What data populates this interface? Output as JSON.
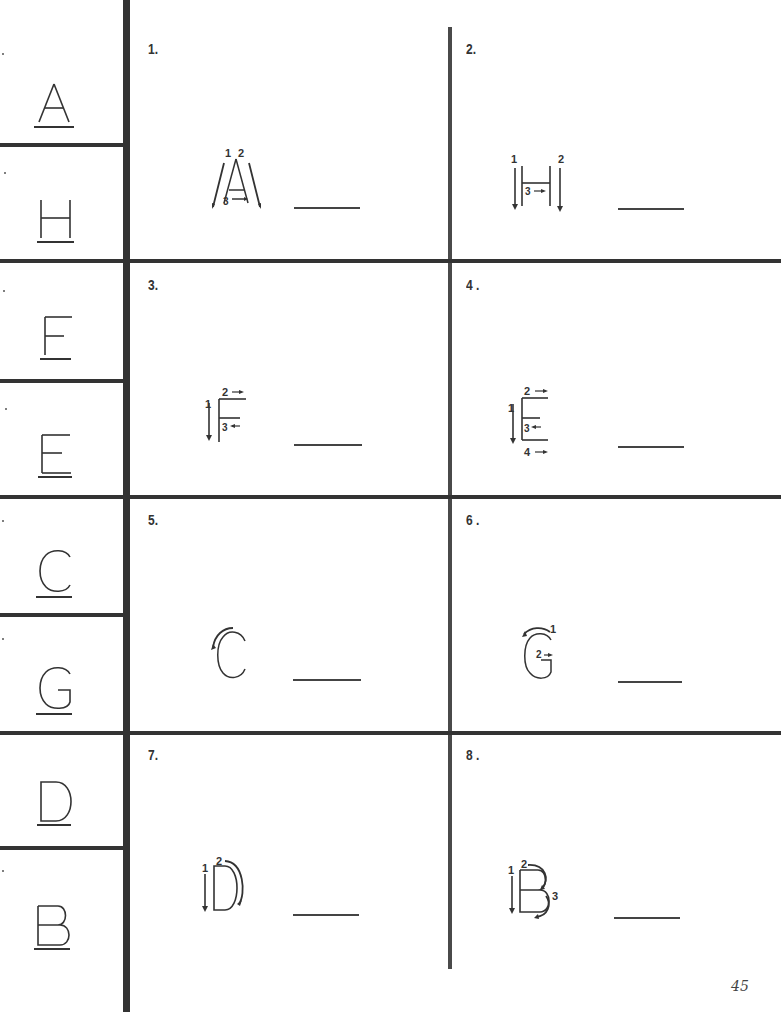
{
  "page": {
    "page_number": "45"
  },
  "reference_letters": [
    {
      "letter": "A"
    },
    {
      "letter": "H"
    },
    {
      "letter": "F"
    },
    {
      "letter": "E"
    },
    {
      "letter": "C"
    },
    {
      "letter": "G"
    },
    {
      "letter": "D"
    },
    {
      "letter": "B"
    }
  ],
  "exercises": [
    {
      "number": "1.",
      "letter": "A",
      "stroke_labels": [
        "1",
        "2",
        "3"
      ]
    },
    {
      "number": "2.",
      "letter": "H",
      "stroke_labels": [
        "1",
        "2",
        "3"
      ]
    },
    {
      "number": "3.",
      "letter": "F",
      "stroke_labels": [
        "1",
        "2",
        "3"
      ]
    },
    {
      "number": "4 .",
      "letter": "E",
      "stroke_labels": [
        "1",
        "2",
        "3",
        "4"
      ]
    },
    {
      "number": "5.",
      "letter": "C",
      "stroke_labels": []
    },
    {
      "number": "6 .",
      "letter": "G",
      "stroke_labels": [
        "1",
        "2"
      ]
    },
    {
      "number": "7.",
      "letter": "D",
      "stroke_labels": [
        "1",
        "2"
      ]
    },
    {
      "number": "8 .",
      "letter": "B",
      "stroke_labels": [
        "1",
        "2",
        "3"
      ]
    }
  ],
  "colors": {
    "ink": "#333333",
    "paper": "#ffffff"
  }
}
